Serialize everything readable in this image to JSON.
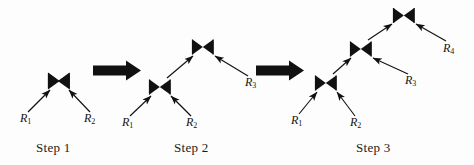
{
  "figure": {
    "background_color": "#fdfdfd",
    "ink_color": "#111111",
    "width": 474,
    "height": 165,
    "join_symbol": "bowtie",
    "join_symbol_glyph": "⋈"
  },
  "captions": [
    {
      "id": "step1",
      "label": "Step 1",
      "x": 36,
      "y": 140
    },
    {
      "id": "step2",
      "label": "Step 2",
      "x": 174,
      "y": 140
    },
    {
      "id": "step3",
      "label": "Step 3",
      "x": 356,
      "y": 140
    }
  ],
  "steps": [
    {
      "id": "step1",
      "caption": "Step 1",
      "joins": [
        {
          "id": "s1-join1",
          "symbol": "⋈",
          "x": 59,
          "y": 81
        }
      ],
      "relations": [
        {
          "id": "s1-R1",
          "name": "R",
          "subscript": "1",
          "x": 20,
          "y": 118
        },
        {
          "id": "s1-R2",
          "name": "R",
          "subscript": "2",
          "x": 84,
          "y": 118
        }
      ],
      "edges": [
        {
          "from": "s1-R1",
          "to": "s1-join1"
        },
        {
          "from": "s1-R2",
          "to": "s1-join1"
        }
      ]
    },
    {
      "id": "step2",
      "caption": "Step 2",
      "joins": [
        {
          "id": "s2-join1",
          "symbol": "⋈",
          "x": 160,
          "y": 87
        },
        {
          "id": "s2-join2",
          "symbol": "⋈",
          "x": 203,
          "y": 47
        }
      ],
      "relations": [
        {
          "id": "s2-R1",
          "name": "R",
          "subscript": "1",
          "x": 122,
          "y": 122
        },
        {
          "id": "s2-R2",
          "name": "R",
          "subscript": "2",
          "x": 186,
          "y": 122
        },
        {
          "id": "s2-R3",
          "name": "R",
          "subscript": "3",
          "x": 245,
          "y": 82
        }
      ],
      "edges": [
        {
          "from": "s2-R1",
          "to": "s2-join1"
        },
        {
          "from": "s2-R2",
          "to": "s2-join1"
        },
        {
          "from": "s2-join1",
          "to": "s2-join2"
        },
        {
          "from": "s2-R3",
          "to": "s2-join2"
        }
      ]
    },
    {
      "id": "step3",
      "caption": "Step 3",
      "joins": [
        {
          "id": "s3-join1",
          "symbol": "⋈",
          "x": 326,
          "y": 83
        },
        {
          "id": "s3-join2",
          "symbol": "⋈",
          "x": 361,
          "y": 49
        },
        {
          "id": "s3-join3",
          "symbol": "⋈",
          "x": 404,
          "y": 15
        }
      ],
      "relations": [
        {
          "id": "s3-R1",
          "name": "R",
          "subscript": "1",
          "x": 292,
          "y": 120
        },
        {
          "id": "s3-R2",
          "name": "R",
          "subscript": "2",
          "x": 350,
          "y": 122
        },
        {
          "id": "s3-R3",
          "name": "R",
          "subscript": "3",
          "x": 405,
          "y": 80
        },
        {
          "id": "s3-R4",
          "name": "R",
          "subscript": "4",
          "x": 443,
          "y": 48
        }
      ],
      "edges": [
        {
          "from": "s3-R1",
          "to": "s3-join1"
        },
        {
          "from": "s3-R2",
          "to": "s3-join1"
        },
        {
          "from": "s3-join1",
          "to": "s3-join2"
        },
        {
          "from": "s3-R3",
          "to": "s3-join2"
        },
        {
          "from": "s3-join2",
          "to": "s3-join3"
        },
        {
          "from": "s3-R4",
          "to": "s3-join3"
        }
      ]
    }
  ],
  "transitions": [
    {
      "id": "arrow-1-2",
      "x": 93,
      "y": 62,
      "width": 48,
      "height": 17
    },
    {
      "id": "arrow-2-3",
      "x": 256,
      "y": 62,
      "width": 48,
      "height": 17
    }
  ]
}
